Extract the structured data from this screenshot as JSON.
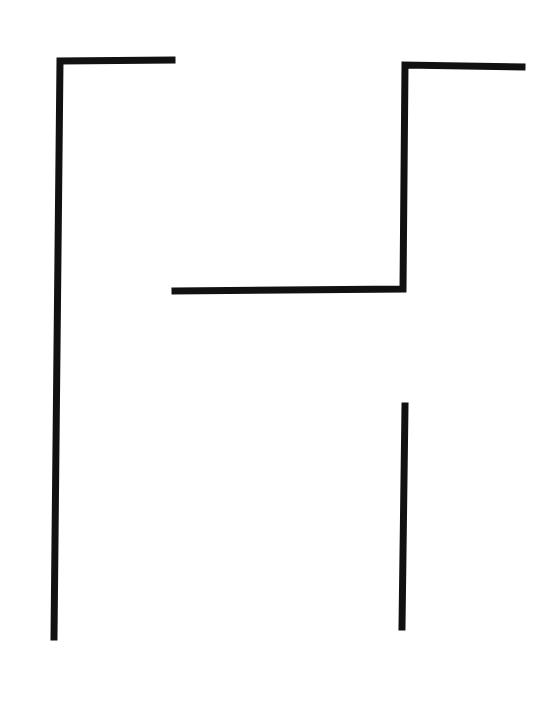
{
  "figure": {
    "width": 555,
    "height": 716,
    "background": "#ffffff",
    "stroke_color": "#111111",
    "stroke_width": 7,
    "strokes": [
      {
        "name": "left-bracket",
        "points": "54,637 60,61 172,60"
      },
      {
        "name": "right-upper-hook",
        "points": "175,291 403,289 405,65 522,67"
      },
      {
        "name": "right-lower-bar",
        "points": "405,406 402,627"
      }
    ]
  }
}
